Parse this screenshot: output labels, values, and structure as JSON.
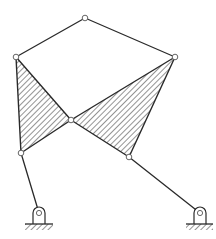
{
  "diagram": {
    "type": "planar-linkage",
    "colors": {
      "line": "#2a2a2a",
      "background": "#ffffff",
      "joint_fill": "#ffffff"
    },
    "joints": [
      {
        "id": "top",
        "kind": "revolute"
      },
      {
        "id": "left-upper",
        "kind": "revolute"
      },
      {
        "id": "right-upper",
        "kind": "revolute"
      },
      {
        "id": "center",
        "kind": "revolute"
      },
      {
        "id": "left-lower",
        "kind": "revolute"
      },
      {
        "id": "right-lower",
        "kind": "revolute"
      },
      {
        "id": "left-ground-pivot",
        "kind": "fixed-pivot"
      },
      {
        "id": "right-ground-pivot",
        "kind": "fixed-pivot"
      }
    ],
    "links": [
      {
        "id": "top-left-bar",
        "joints": [
          "top",
          "left-upper"
        ],
        "kind": "binary"
      },
      {
        "id": "top-right-bar",
        "joints": [
          "top",
          "right-upper"
        ],
        "kind": "binary"
      },
      {
        "id": "left-ternary-plate",
        "joints": [
          "left-upper",
          "center",
          "left-lower"
        ],
        "kind": "ternary",
        "hatched": true
      },
      {
        "id": "right-ternary-plate",
        "joints": [
          "right-upper",
          "center",
          "right-lower"
        ],
        "kind": "ternary",
        "hatched": true
      },
      {
        "id": "left-rocker",
        "joints": [
          "left-lower",
          "left-ground-pivot"
        ],
        "kind": "binary"
      },
      {
        "id": "right-rocker",
        "joints": [
          "right-lower",
          "right-ground-pivot"
        ],
        "kind": "binary"
      }
    ],
    "grounds": [
      "left-ground",
      "right-ground"
    ]
  }
}
